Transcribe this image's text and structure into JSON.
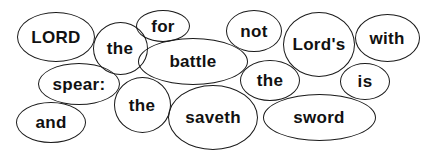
{
  "puzzle": {
    "type": "word-bubble-scramble",
    "stroke_color": "#1a1a1a",
    "text_color": "#111111",
    "background": "#ffffff",
    "bubbles": [
      {
        "id": "lord",
        "word": "LORD",
        "cx": 56,
        "cy": 37,
        "w": 78,
        "h": 50
      },
      {
        "id": "the-1",
        "word": "the",
        "cx": 120,
        "cy": 48,
        "w": 55,
        "h": 53
      },
      {
        "id": "for",
        "word": "for",
        "cx": 163,
        "cy": 26,
        "w": 54,
        "h": 32
      },
      {
        "id": "battle",
        "word": "battle",
        "cx": 193,
        "cy": 61,
        "w": 110,
        "h": 47
      },
      {
        "id": "not",
        "word": "not",
        "cx": 254,
        "cy": 31,
        "w": 56,
        "h": 42
      },
      {
        "id": "lords",
        "word": "Lord's",
        "cx": 319,
        "cy": 44,
        "w": 72,
        "h": 65
      },
      {
        "id": "with",
        "word": "with",
        "cx": 387,
        "cy": 38,
        "w": 65,
        "h": 48
      },
      {
        "id": "spear",
        "word": "spear:",
        "cx": 79,
        "cy": 84,
        "w": 82,
        "h": 42
      },
      {
        "id": "the-2",
        "word": "the",
        "cx": 142,
        "cy": 105,
        "w": 57,
        "h": 56
      },
      {
        "id": "and",
        "word": "and",
        "cx": 51,
        "cy": 122,
        "w": 70,
        "h": 41
      },
      {
        "id": "the-3",
        "word": "the",
        "cx": 270,
        "cy": 80,
        "w": 60,
        "h": 41
      },
      {
        "id": "is",
        "word": "is",
        "cx": 365,
        "cy": 81,
        "w": 50,
        "h": 37
      },
      {
        "id": "saveth",
        "word": "saveth",
        "cx": 213,
        "cy": 117,
        "w": 90,
        "h": 65
      },
      {
        "id": "sword",
        "word": "sword",
        "cx": 319,
        "cy": 117,
        "w": 113,
        "h": 47
      }
    ]
  }
}
